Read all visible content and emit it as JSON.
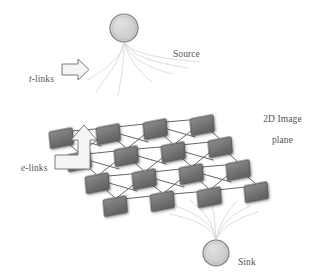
{
  "figure": {
    "background_color": "#ffffff",
    "labels": {
      "source": "Source",
      "sink": "Sink",
      "image_plane_line1": "2D Image",
      "image_plane_line2": "plane",
      "t_links_italic": "t",
      "t_links_rest": "-links",
      "e_links_italic": "e",
      "e_links_rest": "-links"
    },
    "colors": {
      "node_face": "#6f6f6f",
      "node_face_light": "#8a8a8a",
      "node_edge": "#4d4d4d",
      "node_side": "#5a5a5a",
      "terminal_fill": "#cfcfcf",
      "terminal_stroke": "#7d7d7d",
      "grid_edge": "#5d5d5d",
      "tlink_stroke": "#d7d7d7",
      "arrow_fill": "#f2f2f0",
      "arrow_stroke": "#7a7a7a",
      "text": "#55545a"
    },
    "terminals": [
      {
        "name": "source",
        "cx": 124,
        "cy": 28,
        "r": 14
      },
      {
        "name": "sink",
        "cx": 216,
        "cy": 253,
        "r": 13
      }
    ],
    "grid": {
      "rows": 4,
      "cols": 4,
      "node_width": 22,
      "node_height": 16,
      "skew_deg": -14,
      "row_origin_x": [
        62,
        89,
        116,
        143
      ],
      "row_origin_y": [
        131,
        116,
        101,
        86
      ],
      "col_step_x": 47,
      "col_step_y": -4,
      "nodes": [
        {
          "id": "n00",
          "x": 49,
          "y": 132
        },
        {
          "id": "n01",
          "x": 96,
          "y": 128
        },
        {
          "id": "n02",
          "x": 143,
          "y": 123
        },
        {
          "id": "n03",
          "x": 190,
          "y": 119
        },
        {
          "id": "n10",
          "x": 67,
          "y": 155
        },
        {
          "id": "n11",
          "x": 114,
          "y": 150
        },
        {
          "id": "n12",
          "x": 161,
          "y": 146
        },
        {
          "id": "n13",
          "x": 208,
          "y": 141
        },
        {
          "id": "n20",
          "x": 85,
          "y": 177
        },
        {
          "id": "n21",
          "x": 132,
          "y": 173
        },
        {
          "id": "n22",
          "x": 179,
          "y": 168
        },
        {
          "id": "n23",
          "x": 226,
          "y": 164
        },
        {
          "id": "n30",
          "x": 103,
          "y": 200
        },
        {
          "id": "n31",
          "x": 150,
          "y": 195
        },
        {
          "id": "n32",
          "x": 197,
          "y": 191
        },
        {
          "id": "n33",
          "x": 244,
          "y": 186
        }
      ]
    },
    "tlinks": {
      "source_fan_count": 7,
      "sink_fan_count": 7
    },
    "arrows": [
      {
        "name": "t-links-arrow",
        "type": "straight-right",
        "x": 62,
        "y": 62,
        "w": 26,
        "h": 15
      },
      {
        "name": "e-links-arrow",
        "type": "bent-up-right",
        "x": 55,
        "y": 130,
        "w": 48,
        "h": 48
      }
    ]
  }
}
